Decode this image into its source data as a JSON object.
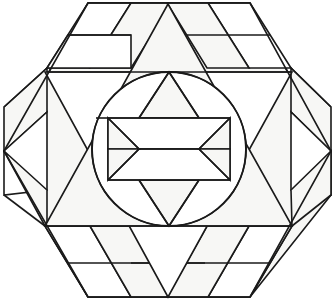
{
  "figure": {
    "canvas": {
      "width": 336,
      "height": 303,
      "background": "#ffffff"
    },
    "stroke_color": "#1a1a1a",
    "fill_light": "#f7f7f5",
    "fill_white": "#ffffff",
    "geometry": {
      "hexagon_vertices": [
        {
          "name": "left",
          "x": 4,
          "y": 151
        },
        {
          "name": "upper-left",
          "x": 88,
          "y": 3
        },
        {
          "name": "upper-right",
          "x": 250,
          "y": 3
        },
        {
          "name": "right",
          "x": 331,
          "y": 151
        },
        {
          "name": "lower-right",
          "x": 250,
          "y": 297
        },
        {
          "name": "lower-left",
          "x": 88,
          "y": 297
        }
      ],
      "band_lines_y": [
        72,
        226
      ],
      "circle": {
        "cx": 169,
        "cy": 149,
        "r": 77
      },
      "big_triangle": [
        {
          "x": 168,
          "y": 4
        },
        {
          "x": 292,
          "y": 226
        },
        {
          "x": 45,
          "y": 226
        }
      ],
      "inverted_triangle": [
        {
          "x": 168,
          "y": 297
        },
        {
          "x": 45,
          "y": 72
        },
        {
          "x": 292,
          "y": 72
        }
      ]
    },
    "regions": [
      {
        "name": "outer-hexagon",
        "kind": "hexagon"
      },
      {
        "name": "top-band",
        "kind": "strip-band"
      },
      {
        "name": "middle-band",
        "kind": "strip-band"
      },
      {
        "name": "bottom-band",
        "kind": "strip-band"
      },
      {
        "name": "central-circle",
        "kind": "circle"
      },
      {
        "name": "six-point-star",
        "kind": "star"
      }
    ]
  }
}
